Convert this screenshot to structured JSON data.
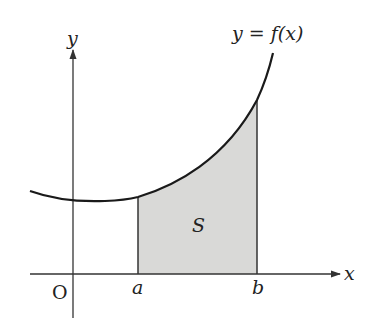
{
  "diagram": {
    "type": "area-under-curve",
    "curve_label": "y = f(x)",
    "region_label": "S",
    "origin_label": "O",
    "x_axis_label": "x",
    "y_axis_label": "y",
    "interval": {
      "lower_label": "a",
      "upper_label": "b"
    },
    "colors": {
      "curve": "#1a1a1a",
      "axes": "#333333",
      "shading": "#d9d9d7",
      "background": "#ffffff"
    }
  }
}
